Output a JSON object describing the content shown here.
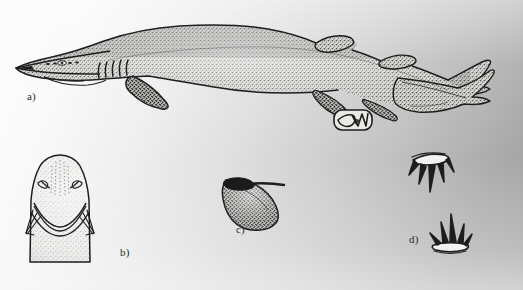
{
  "plate": {
    "title": "Shark morphology plate",
    "background_left_color": "#ffffff",
    "background_right_color": "#a2a2a2",
    "ink_color": "#1e1e1e",
    "width": 523,
    "height": 290,
    "medium": "scanned stipple line drawing"
  },
  "panels": [
    {
      "id": "a",
      "label": "a)",
      "subject": "whole shark, lateral view",
      "features": [
        "elongated flattened snout",
        "five gill slits",
        "pectoral fin",
        "two dorsal fins",
        "pelvic fin",
        "anal fin",
        "long heterocercal caudal fin",
        "eye",
        "nostrils"
      ]
    },
    {
      "id": "b",
      "label": "b)",
      "subject": "head, ventral view",
      "features": [
        "nostrils",
        "arched mouth",
        "labial furrows",
        "underside of snout"
      ]
    },
    {
      "id": "c",
      "label": "c)",
      "subject": "clasper / fin detail",
      "features": [
        "shaded blade",
        "basal rod"
      ]
    },
    {
      "id": "d",
      "label": "d)",
      "subject": "dermal denticles",
      "features": [
        "upper denticle with five cusps",
        "lower denticle with five cusps"
      ]
    }
  ],
  "inset": {
    "id": "inset-detail",
    "label": "",
    "subject": "enlarged tooth / denticle detail in rounded box"
  },
  "icons": {
    "panel_marker": "panel-label-icon"
  }
}
